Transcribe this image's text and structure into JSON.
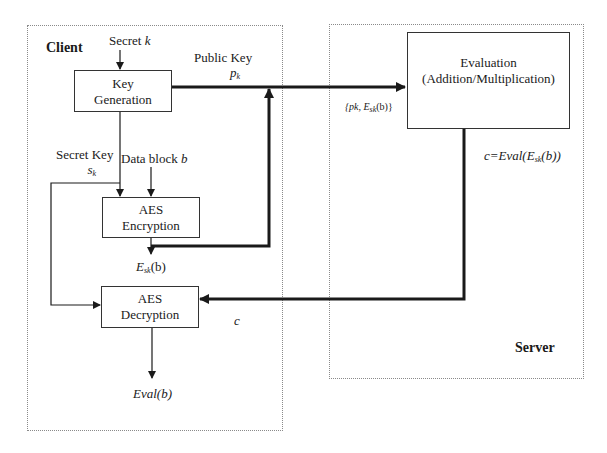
{
  "regions": {
    "client": {
      "label": "Client"
    },
    "server": {
      "label": "Server"
    }
  },
  "blocks": {
    "key_generation": {
      "line1": "Key",
      "line2": "Generation"
    },
    "aes_encryption": {
      "line1": "AES",
      "line2": "Encryption"
    },
    "aes_decryption": {
      "line1": "AES",
      "line2": "Decryption"
    },
    "evaluation": {
      "line1": "Evaluation",
      "line2": "(Addition/Multiplication)"
    }
  },
  "labels": {
    "secret_k": {
      "text": "Secret ",
      "var": "k"
    },
    "public_key": {
      "line1": "Public Key",
      "var": "p",
      "sub": "k"
    },
    "secret_key": {
      "line1": "Secret Key",
      "var": "s",
      "sub": "k"
    },
    "data_block": {
      "text": "Data block ",
      "var": "b"
    },
    "encrypted": {
      "pre": "E",
      "sub": "sk",
      "post": "(b)"
    },
    "sent_to_server": {
      "pre": "{pk, E",
      "sub": "sk",
      "post": "(b)}"
    },
    "server_result": {
      "pre": "c=Eval(E",
      "sub": "sk",
      "post": "(b))"
    },
    "ciphertext_c": {
      "text": "c"
    },
    "output": {
      "text": "Eval(b)"
    }
  },
  "colors": {
    "line": "#1a1a1a",
    "border": "#333333",
    "region_border": "#8a8a8a"
  }
}
